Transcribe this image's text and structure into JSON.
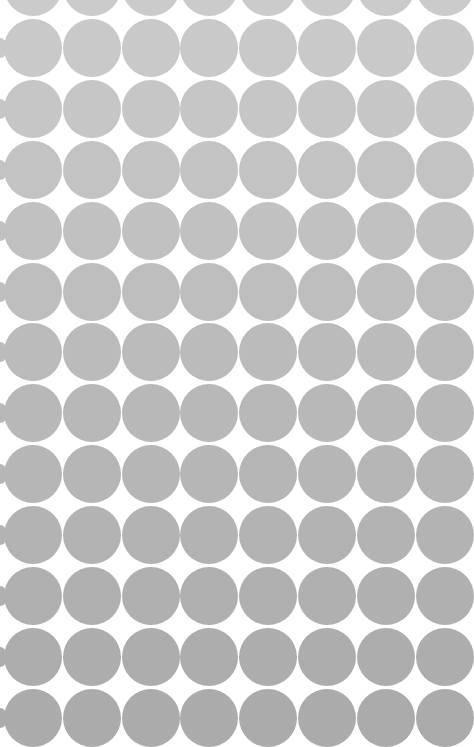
{
  "pattern": {
    "name": "polka-dot-texture",
    "background": "#ffffff",
    "dot_diameter": 58,
    "col_spacing": 58.8,
    "row_spacing": 60.9,
    "first_col_center_x": 33,
    "first_row_center_y": -13,
    "cols": 8,
    "rows": 13,
    "color_top": "#cbcbcb",
    "color_bottom": "#ababab"
  }
}
